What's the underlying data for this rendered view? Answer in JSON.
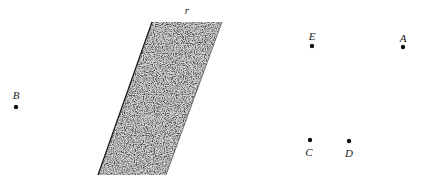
{
  "diagram": {
    "band": {
      "label": "r",
      "label_pos": [
        187,
        14
      ],
      "corners": [
        [
          152,
          22
        ],
        [
          222,
          22
        ],
        [
          166,
          175
        ],
        [
          98,
          175
        ]
      ],
      "fill_style": "stippled-noise",
      "ink_color": "#1a1a1a"
    },
    "points": [
      {
        "id": "B",
        "label": "B",
        "dot": [
          16,
          107
        ],
        "label_pos": [
          16,
          99
        ]
      },
      {
        "id": "E",
        "label": "E",
        "dot": [
          312,
          46
        ],
        "label_pos": [
          312,
          40
        ]
      },
      {
        "id": "A",
        "label": "A",
        "dot": [
          403,
          47
        ],
        "label_pos": [
          403,
          42
        ]
      },
      {
        "id": "C",
        "label": "C",
        "dot": [
          310,
          140
        ],
        "label_pos": [
          309,
          156
        ]
      },
      {
        "id": "D",
        "label": "D",
        "dot": [
          349,
          141
        ],
        "label_pos": [
          349,
          157
        ]
      }
    ],
    "dot_radius": 2.2,
    "dot_color": "#111111"
  }
}
